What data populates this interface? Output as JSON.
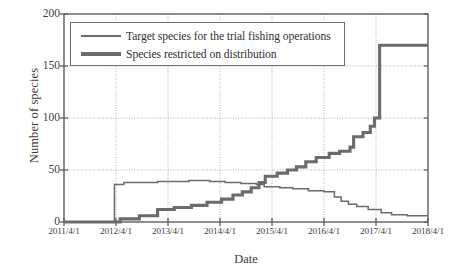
{
  "chart_data": {
    "type": "line",
    "title": "",
    "xlabel": "Date",
    "ylabel": "Number of species",
    "xtick_labels": [
      "2011/4/1",
      "2012/4/1",
      "2013/4/1",
      "2014/4/1",
      "2015/4/1",
      "2016/4/1",
      "2017/4/1",
      "2018/4/1"
    ],
    "ytick_labels": [
      "0",
      "50",
      "100",
      "150",
      "200"
    ],
    "ylim": [
      0,
      200
    ],
    "xlim": [
      "2011/4/1",
      "2018/4/1"
    ],
    "grid": true,
    "legend_position": "upper-left",
    "line_color": "#6b6b6b",
    "series": [
      {
        "name": "Target species for the trial fishing operations",
        "style": "thin",
        "step": true,
        "points": [
          [
            2011.25,
            0
          ],
          [
            2012.25,
            0
          ],
          [
            2012.33,
            3
          ],
          [
            2012.6,
            3
          ],
          [
            2012.7,
            6
          ],
          [
            2013.0,
            6
          ],
          [
            2013.05,
            12
          ],
          [
            2013.3,
            12
          ],
          [
            2013.37,
            14
          ],
          [
            2013.62,
            14
          ],
          [
            2013.7,
            16
          ],
          [
            2013.95,
            16
          ],
          [
            2014.0,
            19
          ],
          [
            2014.2,
            19
          ],
          [
            2014.28,
            22
          ],
          [
            2014.45,
            22
          ],
          [
            2014.5,
            26
          ],
          [
            2014.62,
            26
          ],
          [
            2014.68,
            29
          ],
          [
            2014.8,
            29
          ],
          [
            2014.85,
            33
          ],
          [
            2014.95,
            33
          ],
          [
            2015.0,
            38
          ],
          [
            2015.08,
            38
          ],
          [
            2015.12,
            44
          ],
          [
            2015.3,
            44
          ],
          [
            2015.35,
            47
          ],
          [
            2015.5,
            47
          ],
          [
            2015.55,
            50
          ],
          [
            2015.68,
            50
          ],
          [
            2015.72,
            53
          ],
          [
            2015.85,
            53
          ],
          [
            2015.9,
            58
          ],
          [
            2016.05,
            58
          ],
          [
            2016.1,
            62
          ],
          [
            2016.3,
            62
          ],
          [
            2016.35,
            66
          ],
          [
            2016.5,
            66
          ],
          [
            2016.55,
            68
          ],
          [
            2016.7,
            68
          ],
          [
            2016.75,
            72
          ],
          [
            2016.78,
            72
          ],
          [
            2016.82,
            82
          ],
          [
            2016.95,
            82
          ],
          [
            2017.0,
            86
          ],
          [
            2017.1,
            86
          ],
          [
            2017.14,
            92
          ],
          [
            2017.2,
            92
          ],
          [
            2017.22,
            100
          ],
          [
            2017.3,
            100
          ],
          [
            2017.32,
            170
          ],
          [
            2018.25,
            170
          ]
        ]
      },
      {
        "name": "Species restricted on distribution",
        "style": "thick",
        "step": true,
        "points": [
          [
            2011.25,
            0
          ],
          [
            2012.2,
            0
          ],
          [
            2012.22,
            36
          ],
          [
            2012.35,
            36
          ],
          [
            2012.4,
            38
          ],
          [
            2013.0,
            38
          ],
          [
            2013.05,
            39
          ],
          [
            2013.6,
            39
          ],
          [
            2013.65,
            40
          ],
          [
            2014.0,
            40
          ],
          [
            2014.05,
            39
          ],
          [
            2014.3,
            39
          ],
          [
            2014.35,
            38
          ],
          [
            2014.6,
            38
          ],
          [
            2014.65,
            37
          ],
          [
            2014.9,
            37
          ],
          [
            2014.95,
            36
          ],
          [
            2015.05,
            36
          ],
          [
            2015.1,
            34
          ],
          [
            2015.35,
            34
          ],
          [
            2015.4,
            33
          ],
          [
            2015.6,
            33
          ],
          [
            2015.65,
            32
          ],
          [
            2015.9,
            32
          ],
          [
            2015.95,
            30
          ],
          [
            2016.2,
            30
          ],
          [
            2016.25,
            29
          ],
          [
            2016.42,
            29
          ],
          [
            2016.45,
            24
          ],
          [
            2016.55,
            24
          ],
          [
            2016.58,
            20
          ],
          [
            2016.68,
            20
          ],
          [
            2016.72,
            17
          ],
          [
            2016.85,
            17
          ],
          [
            2016.88,
            15
          ],
          [
            2017.05,
            15
          ],
          [
            2017.1,
            12
          ],
          [
            2017.3,
            12
          ],
          [
            2017.35,
            9
          ],
          [
            2017.5,
            9
          ],
          [
            2017.55,
            7
          ],
          [
            2017.8,
            7
          ],
          [
            2017.85,
            6
          ],
          [
            2018.25,
            6
          ]
        ]
      }
    ]
  },
  "axes": {
    "x_start": 2011.25,
    "x_end": 2018.25
  }
}
